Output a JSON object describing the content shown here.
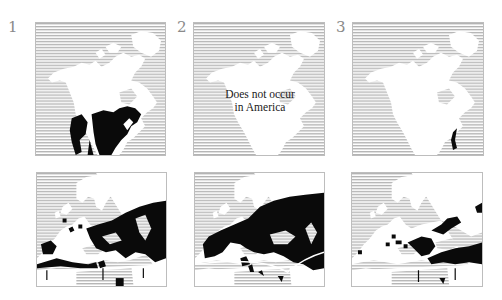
{
  "figure": {
    "colors": {
      "sea_hatch": "#b9b9b9",
      "land": "#ffffff",
      "range": "#0a0a0a",
      "border": "#bdbdbd",
      "label": "#8a8a8a"
    },
    "columns": [
      {
        "number": "1",
        "america_note": "",
        "america_range": "large range across central/eastern United States and western mountains",
        "europe_range": "southern Europe, Iberia, Balkans, Anatolia, Caucasus, North Africa coast"
      },
      {
        "number": "2",
        "america_note_line1": "Does not occur",
        "america_note_line2": "in America",
        "america_range": "none",
        "europe_range": "broad band across central and eastern Europe to the Mediterranean"
      },
      {
        "number": "3",
        "america_note": "",
        "america_range": "small strip on southeast Atlantic coast",
        "europe_range": "Balkans, Anatolia, Middle East and scattered spots in southern Europe"
      }
    ],
    "rows": [
      "North America",
      "Europe"
    ]
  }
}
